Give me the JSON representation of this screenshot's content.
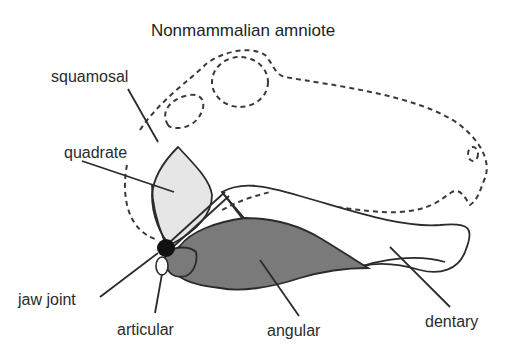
{
  "title": "Nonmammalian amniote",
  "labels": {
    "squamosal": "squamosal",
    "quadrate": "quadrate",
    "jaw_joint": "jaw joint",
    "articular": "articular",
    "angular": "angular",
    "dentary": "dentary"
  },
  "colors": {
    "quadrate_fill": "#e6e6e6",
    "angular_fill": "#7a7a7a",
    "joint_fill": "#111111",
    "outline": "#2a2a2a"
  }
}
